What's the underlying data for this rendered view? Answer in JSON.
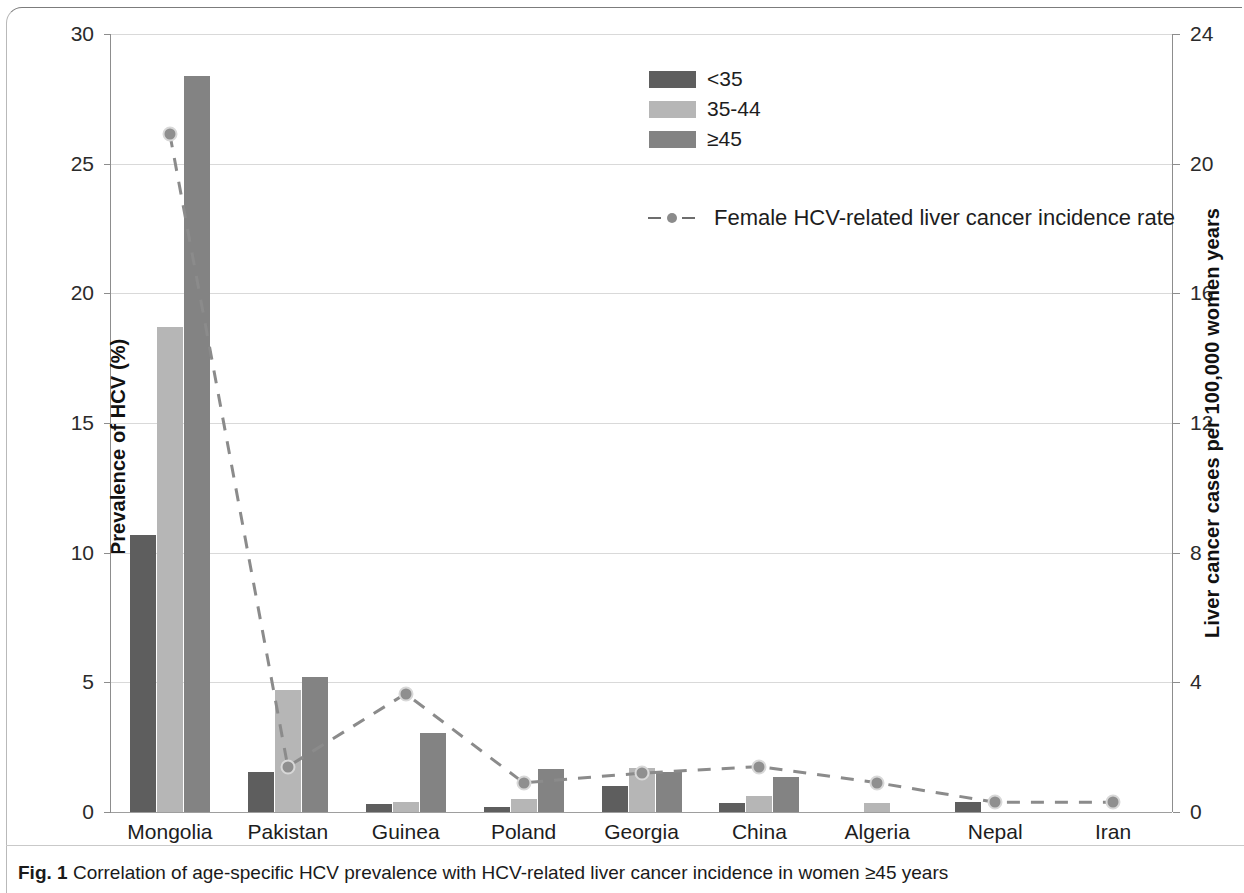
{
  "caption": {
    "figure_number": "Fig. 1",
    "text": "Correlation of age-specific HCV prevalence with HCV-related liver cancer incidence in women ≥45 years"
  },
  "legend": {
    "bar_items": [
      {
        "label": "<35",
        "color": "#5e5e5e"
      },
      {
        "label": "35-44",
        "color": "#b6b6b6"
      },
      {
        "label": "≥45",
        "color": "#838383"
      }
    ],
    "line_item": {
      "label": "Female HCV-related liver cancer incidence rate",
      "color": "#8b8b8b"
    }
  },
  "axes": {
    "y_left": {
      "title": "Prevalence of HCV (%)",
      "ticks": [
        "0",
        "5",
        "10",
        "15",
        "20",
        "25",
        "30"
      ],
      "min": 0,
      "max": 30
    },
    "y_right": {
      "title": "Liver cancer cases per 100,000 women years",
      "ticks": [
        "0",
        "4",
        "8",
        "12",
        "16",
        "20",
        "24"
      ],
      "min": 0,
      "max": 24
    },
    "x": {
      "categories": [
        "Mongolia",
        "Pakistan",
        "Guinea",
        "Poland",
        "Georgia",
        "China",
        "Algeria",
        "Nepal",
        "Iran"
      ]
    }
  },
  "chart_data": {
    "type": "bar",
    "title": "Correlation of age-specific HCV prevalence with HCV-related liver cancer incidence in women ≥45 years",
    "xlabel": "",
    "ylabel": "Prevalence of HCV (%)",
    "y2label": "Liver cancer cases per 100,000 women years",
    "ylim": [
      0,
      30
    ],
    "y2lim": [
      0,
      24
    ],
    "grid": true,
    "legend_position": "top-center",
    "categories": [
      "Mongolia",
      "Pakistan",
      "Guinea",
      "Poland",
      "Georgia",
      "China",
      "Algeria",
      "Nepal",
      "Iran"
    ],
    "series": [
      {
        "name": "<35",
        "axis": "left",
        "type": "bar",
        "color": "#5e5e5e",
        "values": [
          10.7,
          1.55,
          0.3,
          0.2,
          1.0,
          0.35,
          0.0,
          0.4,
          0.0
        ]
      },
      {
        "name": "35-44",
        "axis": "left",
        "type": "bar",
        "color": "#b6b6b6",
        "values": [
          18.7,
          4.7,
          0.4,
          0.5,
          1.7,
          0.6,
          0.35,
          0.0,
          0.0
        ]
      },
      {
        "name": "≥45",
        "axis": "left",
        "type": "bar",
        "color": "#838383",
        "values": [
          28.4,
          5.2,
          3.05,
          1.65,
          1.55,
          1.35,
          0.0,
          0.0,
          0.0
        ]
      },
      {
        "name": "Female HCV-related liver cancer incidence rate",
        "axis": "right",
        "type": "line",
        "color": "#8b8b8b",
        "values": [
          20.9,
          1.4,
          3.65,
          0.9,
          1.2,
          1.4,
          0.9,
          0.3,
          0.3
        ]
      }
    ]
  }
}
